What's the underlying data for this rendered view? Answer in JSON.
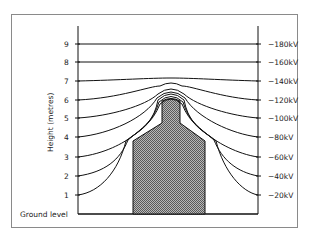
{
  "diagram": {
    "type": "electric-field-equipotential",
    "y_axis_label": "Height (metres)",
    "ground_label": "Ground level",
    "left_ticks": [
      "1",
      "2",
      "3",
      "4",
      "5",
      "6",
      "7",
      "8",
      "9"
    ],
    "right_labels": [
      "−20kV",
      "−40kV",
      "−60kV",
      "−80kV",
      "−100kV",
      "−120kV",
      "−140kV",
      "−160kV",
      "−180kV"
    ],
    "object": "shaded building with narrow top (bottle shape)"
  }
}
